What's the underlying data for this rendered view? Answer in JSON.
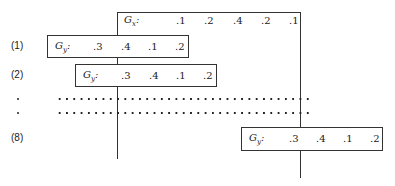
{
  "gx": {
    "label": "G",
    "sub": "x",
    "colon": ":",
    "values": [
      ".1",
      ".2",
      ".4",
      ".2",
      ".1"
    ]
  },
  "rows": [
    {
      "step": "(1)",
      "label": "G",
      "sub": "y",
      "colon": ":",
      "values": [
        ".3",
        ".4",
        ".1",
        ".2"
      ]
    },
    {
      "step": "(2)",
      "label": "G",
      "sub": "y",
      "colon": ":",
      "values": [
        ".3",
        ".4",
        ".1",
        ".2"
      ]
    },
    {
      "step": "(8)",
      "label": "G",
      "sub": "y",
      "colon": ":",
      "values": [
        ".3",
        ".4",
        ".1",
        ".2"
      ]
    }
  ],
  "ellipsis_markers": [
    "•",
    "•"
  ]
}
